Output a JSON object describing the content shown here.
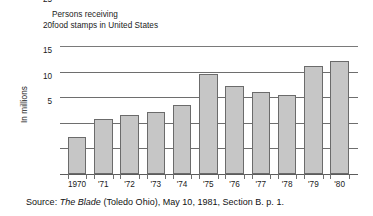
{
  "chart_data": {
    "type": "bar",
    "title": "Persons receiving food stamps in United States",
    "title_lines": [
      "Persons receiving",
      "food stamps in United States"
    ],
    "xlabel": "",
    "ylabel": "In millions",
    "categories": [
      "1970",
      "'71",
      "'72",
      "'73",
      "'74",
      "'75",
      "'76",
      "'77",
      "'78",
      "'79",
      "'80"
    ],
    "values": [
      7.2,
      10.8,
      11.5,
      12.1,
      13.4,
      19.5,
      17.2,
      16.1,
      15.5,
      21.0,
      22.0
    ],
    "ylim": [
      0,
      25
    ],
    "yticks": [
      5,
      10,
      15,
      20,
      25
    ],
    "ytick_labels": [
      "5",
      "10",
      "15",
      "20",
      "25"
    ],
    "grid": true,
    "grid_axis": "y",
    "legend": false,
    "bar_fill": "#c6c6c6",
    "bar_edge": "#6b6b6b",
    "axis_color": "#5c5c5c",
    "background": "#ffffff"
  },
  "caption": {
    "prefix": "Source: ",
    "publication": "The Blade",
    "suffix": " (Toledo Ohio), May 10, 1981, Section B. p. 1."
  }
}
